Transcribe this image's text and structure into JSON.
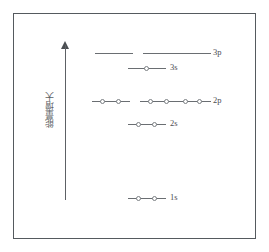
{
  "figure": {
    "axis": {
      "label": "能量增大",
      "arrow_direction": "up",
      "icon": "up-arrow-icon"
    },
    "colors": {
      "frame": "#555a5e",
      "line": "#6a6e72",
      "electron_stroke": "#7b7f83",
      "text": "#4a4e52",
      "background": "#ffffff"
    },
    "levels": [
      {
        "id": "3p",
        "label": "3p",
        "y": 48,
        "label_x": 213,
        "orbitals": [
          {
            "x": 95,
            "width": 38,
            "electrons": 0
          },
          {
            "x": 143,
            "width": 38,
            "electrons": 0
          },
          {
            "x": 181,
            "width": 30,
            "electrons": 0
          }
        ]
      },
      {
        "id": "3s",
        "label": "3s",
        "y": 63,
        "label_x": 170,
        "orbitals": [
          {
            "x": 128,
            "width": 38,
            "electrons": 1
          }
        ]
      },
      {
        "id": "2p",
        "label": "2p",
        "y": 96,
        "label_x": 213,
        "orbitals": [
          {
            "x": 92,
            "width": 38,
            "electrons": 2
          },
          {
            "x": 140,
            "width": 38,
            "electrons": 2
          },
          {
            "x": 175,
            "width": 36,
            "electrons": 2
          }
        ]
      },
      {
        "id": "2s",
        "label": "2s",
        "y": 119,
        "label_x": 170,
        "orbitals": [
          {
            "x": 128,
            "width": 38,
            "electrons": 2
          }
        ]
      },
      {
        "id": "1s",
        "label": "1s",
        "y": 193,
        "label_x": 170,
        "orbitals": [
          {
            "x": 128,
            "width": 38,
            "electrons": 2
          }
        ]
      }
    ]
  },
  "chart_data": {
    "type": "diagram",
    "ylabel": "能量增大",
    "grid": false,
    "legend": "none",
    "series": [
      {
        "name": "1s",
        "orbitals": 1,
        "electrons_per_orbital": [
          2
        ],
        "relative_energy": 1
      },
      {
        "name": "2s",
        "orbitals": 1,
        "electrons_per_orbital": [
          2
        ],
        "relative_energy": 2
      },
      {
        "name": "2p",
        "orbitals": 3,
        "electrons_per_orbital": [
          2,
          2,
          2
        ],
        "relative_energy": 3
      },
      {
        "name": "3s",
        "orbitals": 1,
        "electrons_per_orbital": [
          1
        ],
        "relative_energy": 4
      },
      {
        "name": "3p",
        "orbitals": 3,
        "electrons_per_orbital": [
          0,
          0,
          0
        ],
        "relative_energy": 5
      }
    ]
  }
}
